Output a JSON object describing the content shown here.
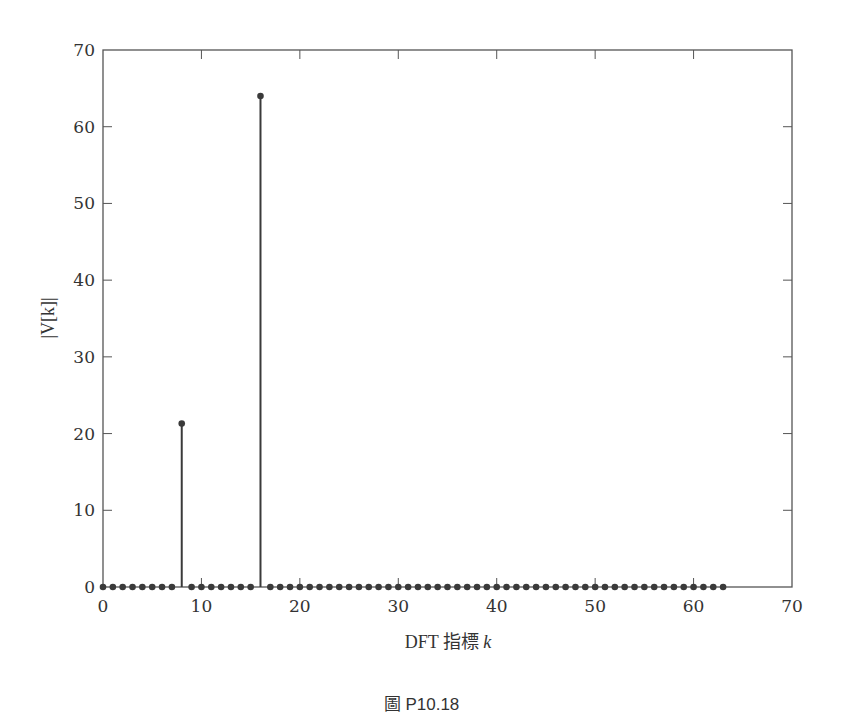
{
  "chart_data": {
    "type": "stem",
    "title": "",
    "xlabel": "DFT 指標 k",
    "ylabel": "|V[k]|",
    "xlim": [
      0,
      70
    ],
    "ylim": [
      0,
      70
    ],
    "xticks": [
      0,
      10,
      20,
      30,
      40,
      50,
      60,
      70
    ],
    "yticks": [
      0,
      10,
      20,
      30,
      40,
      50,
      60,
      70
    ],
    "grid": false,
    "legend": null,
    "series": [
      {
        "name": "|V[k]|",
        "x": [
          0,
          1,
          2,
          3,
          4,
          5,
          6,
          7,
          8,
          9,
          10,
          11,
          12,
          13,
          14,
          15,
          16,
          17,
          18,
          19,
          20,
          21,
          22,
          23,
          24,
          25,
          26,
          27,
          28,
          29,
          30,
          31,
          32,
          33,
          34,
          35,
          36,
          37,
          38,
          39,
          40,
          41,
          42,
          43,
          44,
          45,
          46,
          47,
          48,
          49,
          50,
          51,
          52,
          53,
          54,
          55,
          56,
          57,
          58,
          59,
          60,
          61,
          62,
          63
        ],
        "values": [
          0,
          0,
          0,
          0,
          0,
          0,
          0,
          0,
          21.3,
          0,
          0,
          0,
          0,
          0,
          0,
          0,
          64,
          0,
          0,
          0,
          0,
          0,
          0,
          0,
          0,
          0,
          0,
          0,
          0,
          0,
          0,
          0,
          0,
          0,
          0,
          0,
          0,
          0,
          0,
          0,
          0,
          0,
          0,
          0,
          0,
          0,
          0,
          0,
          0,
          0,
          0,
          0,
          0,
          0,
          0,
          0,
          0,
          0,
          0,
          0,
          0,
          0,
          0,
          0
        ]
      }
    ],
    "colors": {
      "stem": "#3a3a3a",
      "axis": "#555555"
    }
  },
  "labels": {
    "xlabel_prefix": "DFT 指標 ",
    "xlabel_var": "k",
    "ylabel": "|V[k]|",
    "caption": "圖 P10.18"
  }
}
